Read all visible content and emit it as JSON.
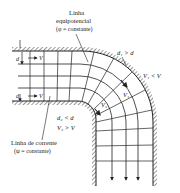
{
  "figure": {
    "type": "flow-net",
    "labels": {
      "equipotential_line": "Linha",
      "equipotential_line_2": "equipotencial",
      "equipotential_const": "(φ = constante)",
      "streamline": "Linha de corrente",
      "streamline_const": "(ψ = constante)",
      "d_top": "d",
      "v_top": "V",
      "d_bottom": "d",
      "v_bottom": "V",
      "d1_relation": "d₁ > d",
      "v1_relation": "V₁ < V",
      "v1_label": "V₁",
      "v2_label": "V₂",
      "d2_relation": "d₂ < d",
      "v2_relation": "V₂ > V"
    },
    "colors": {
      "line": "#222222",
      "background": "#ffffff"
    }
  }
}
